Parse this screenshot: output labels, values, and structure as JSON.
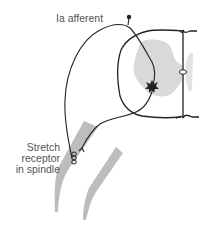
{
  "figure": {
    "type": "stretch reflex schematic",
    "labels": {
      "afferent": "Ia afferent",
      "receptor_lines": [
        "Stretch",
        "receptor",
        "in spindle"
      ]
    },
    "colors": {
      "line": "#222222",
      "gray_matter": "#d9d9d9",
      "muscle": "#bdbdbd",
      "text": "#555555",
      "background": "#ffffff"
    },
    "elements": [
      {
        "name": "Ia afferent fiber",
        "kind": "line"
      },
      {
        "name": "dorsal root ganglion",
        "kind": "dot"
      },
      {
        "name": "spinal cord outline",
        "kind": "outline"
      },
      {
        "name": "gray matter",
        "kind": "region"
      },
      {
        "name": "central canal",
        "kind": "ellipse"
      },
      {
        "name": "motor neuron",
        "kind": "star"
      },
      {
        "name": "motor efferent fiber",
        "kind": "line"
      },
      {
        "name": "muscle",
        "kind": "band"
      },
      {
        "name": "muscle spindle receptor",
        "kind": "coil"
      }
    ]
  }
}
